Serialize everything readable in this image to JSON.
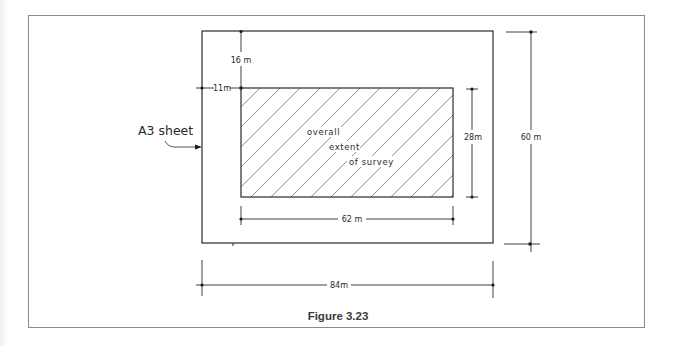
{
  "figure": {
    "caption": "Figure 3.23"
  },
  "labels": {
    "sheet": "A3 sheet",
    "hatch_line1": "overall",
    "hatch_line2": "extent",
    "hatch_line3": "of survey"
  },
  "dimensions": {
    "top_margin": "16 m",
    "left_margin": "11m",
    "survey_height": "28m",
    "sheet_height": "60 m",
    "survey_width": "62 m",
    "sheet_width": "84m"
  },
  "colors": {
    "line": "#2a2a2a",
    "hatch": "#777777",
    "frame": "#8a8a8a"
  }
}
